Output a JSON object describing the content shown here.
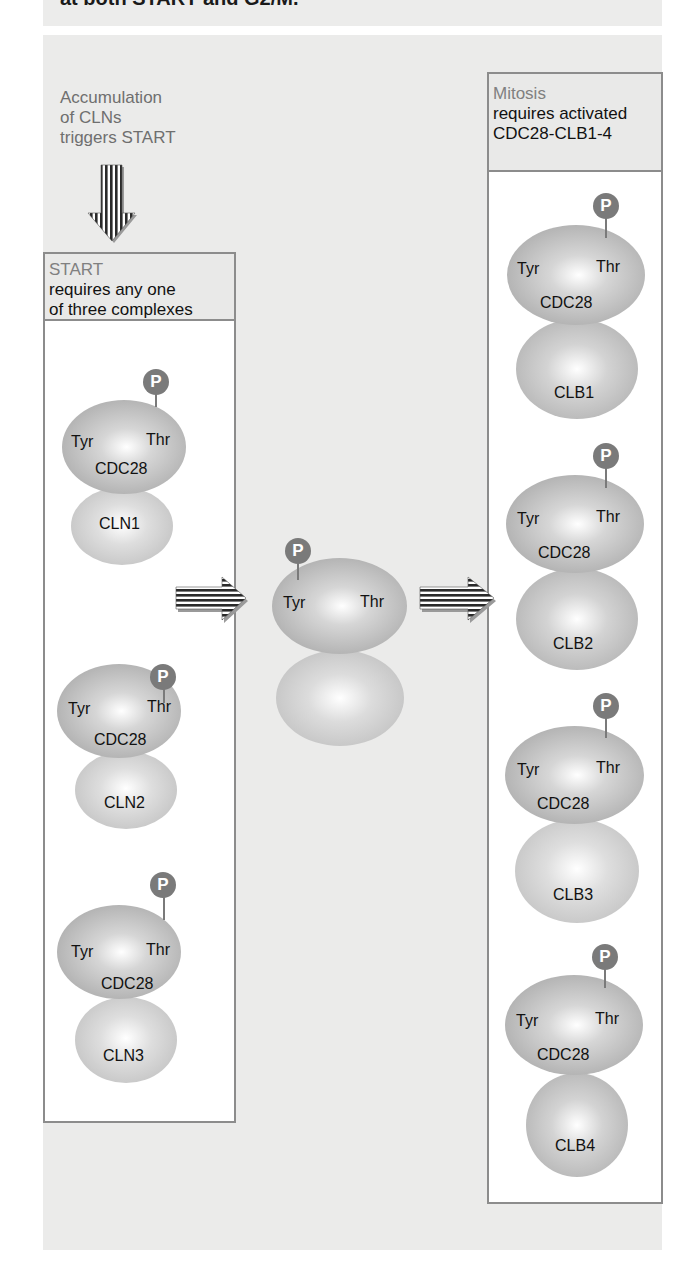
{
  "header": {
    "cut_off_text": "at both START and G2/M."
  },
  "trigger_caption": {
    "lines": [
      "Accumulation",
      "of CLNs",
      "triggers START"
    ]
  },
  "start_box": {
    "title": "START",
    "line1": "requires any one",
    "line2": "of three complexes",
    "complexes": [
      {
        "kinase": "CDC28",
        "cyclin": "CLN1",
        "site_left": "Tyr",
        "site_right": "Thr",
        "phospho": "P"
      },
      {
        "kinase": "CDC28",
        "cyclin": "CLN2",
        "site_left": "Tyr",
        "site_right": "Thr",
        "phospho": "P"
      },
      {
        "kinase": "CDC28",
        "cyclin": "CLN3",
        "site_left": "Tyr",
        "site_right": "Thr",
        "phospho": "P"
      }
    ]
  },
  "middle_complex": {
    "site_left": "Tyr",
    "site_right": "Thr",
    "phospho": "P"
  },
  "mitosis_box": {
    "title": "Mitosis",
    "line1": "requires activated",
    "line2": "CDC28-CLB1-4",
    "complexes": [
      {
        "kinase": "CDC28",
        "cyclin": "CLB1",
        "site_left": "Tyr",
        "site_right": "Thr",
        "phospho": "P"
      },
      {
        "kinase": "CDC28",
        "cyclin": "CLB2",
        "site_left": "Tyr",
        "site_right": "Thr",
        "phospho": "P"
      },
      {
        "kinase": "CDC28",
        "cyclin": "CLB3",
        "site_left": "Tyr",
        "site_right": "Thr",
        "phospho": "P"
      },
      {
        "kinase": "CDC28",
        "cyclin": "CLB4",
        "site_left": "Tyr",
        "site_right": "Thr",
        "phospho": "P"
      }
    ]
  },
  "colors": {
    "panel_bg": "#ebebea",
    "border": "#8c8c8c",
    "phospho": "#7a7a7a",
    "caption": "#6f6f6f"
  }
}
